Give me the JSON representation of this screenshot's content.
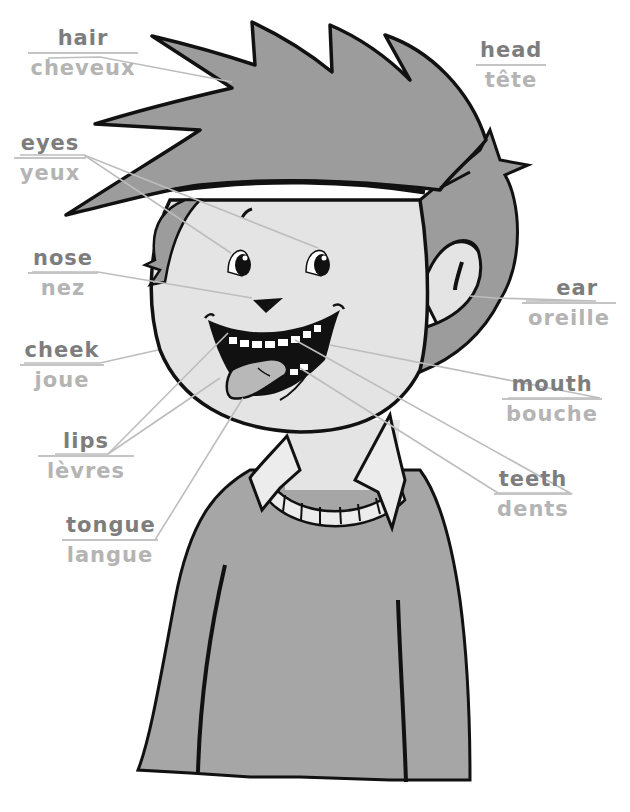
{
  "colors": {
    "english_text": "#7d7d7d",
    "french_text": "#b4b4b4",
    "leader_line": "#bdbdbd",
    "hair": "#9c9c9c",
    "skin": "#e4e4e4",
    "sweater": "#a6a6a6",
    "collar": "#ececec",
    "tongue": "#b8b8b8",
    "outline": "#111111"
  },
  "labels": [
    {
      "id": "hair",
      "english": "hair",
      "french": "cheveux",
      "x": 18,
      "y": 26,
      "w": 110
    },
    {
      "id": "head",
      "english": "head",
      "french": "tête",
      "x": 476,
      "y": 38,
      "w": 70
    },
    {
      "id": "eyes",
      "english": "eyes",
      "french": "yeux",
      "x": 18,
      "y": 130,
      "w": 72
    },
    {
      "id": "nose",
      "english": "nose",
      "french": "nez",
      "x": 28,
      "y": 245,
      "w": 70
    },
    {
      "id": "ear",
      "english": "ear",
      "french": "oreille",
      "x": 524,
      "y": 275,
      "w": 90
    },
    {
      "id": "cheek",
      "english": "cheek",
      "french": "joue",
      "x": 22,
      "y": 337,
      "w": 80
    },
    {
      "id": "mouth",
      "english": "mouth",
      "french": "bouche",
      "x": 504,
      "y": 372,
      "w": 96
    },
    {
      "id": "lips",
      "english": "lips",
      "french": "lèvres",
      "x": 50,
      "y": 428,
      "w": 78
    },
    {
      "id": "teeth",
      "english": "teeth",
      "french": "dents",
      "x": 496,
      "y": 467,
      "w": 76
    },
    {
      "id": "tongue",
      "english": "tongue",
      "french": "langue",
      "x": 63,
      "y": 512,
      "w": 96
    }
  ]
}
